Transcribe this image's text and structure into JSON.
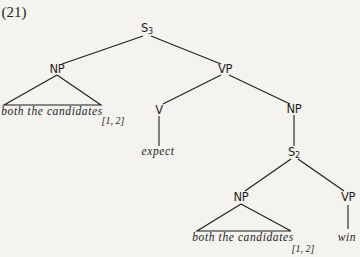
{
  "example_number": "(21)",
  "tree": {
    "root": {
      "label": "S",
      "subscript": "3"
    },
    "subject_np": {
      "label": "NP",
      "terminal": "both the candidates",
      "index": "[1, 2]"
    },
    "vp": {
      "label": "VP",
      "verb": {
        "label": "V",
        "terminal": "expect"
      },
      "object_np": {
        "label": "NP",
        "embedded_s": {
          "label": "S",
          "subscript": "2",
          "np": {
            "label": "NP",
            "terminal": "both the candidates",
            "index": "[1, 2]"
          },
          "vp": {
            "label": "VP",
            "terminal": "win"
          }
        }
      }
    }
  },
  "colors": {
    "background": "#f4f3ef",
    "ink": "#1e1e1e"
  }
}
